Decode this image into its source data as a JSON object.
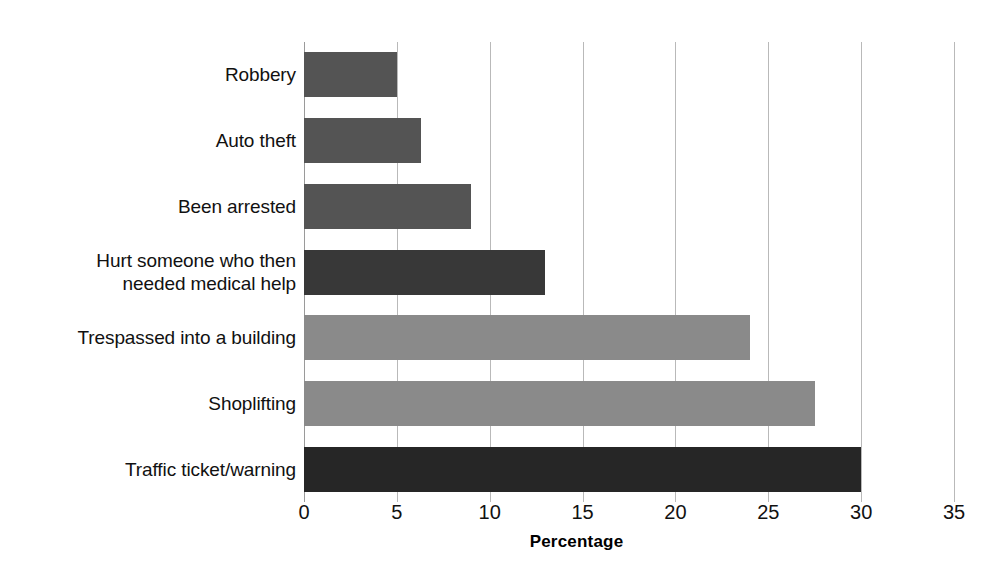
{
  "chart_data": {
    "type": "bar",
    "orientation": "horizontal",
    "title": "",
    "subtitle": "",
    "xlabel": "Percentage",
    "ylabel": "",
    "categories": [
      "Robbery",
      "Auto theft",
      "Been arrested",
      "Hurt someone who then\nneeded medical help",
      "Trespassed into a building",
      "Shoplifting",
      "Traffic ticket/warning"
    ],
    "values": [
      5.0,
      6.3,
      9.0,
      13.0,
      24.0,
      27.5,
      30.0
    ],
    "bar_colors": [
      "#545454",
      "#545454",
      "#545454",
      "#383838",
      "#8a8a8a",
      "#8a8a8a",
      "#262626"
    ],
    "xlim": [
      0,
      35
    ],
    "xticks": [
      0,
      5,
      10,
      15,
      20,
      25,
      30,
      35
    ],
    "xtick_labels": [
      "0",
      "5",
      "10",
      "15",
      "20",
      "25",
      "30",
      "35"
    ],
    "grid": "vertical",
    "gridline_color": "#b9b9b9",
    "legend": null,
    "legend_position": "none",
    "background": "#ffffff"
  },
  "axis": {
    "title": "Percentage"
  }
}
